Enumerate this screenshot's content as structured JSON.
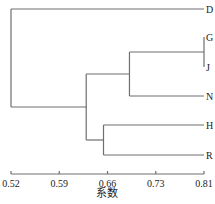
{
  "chart_data": {
    "type": "dendrogram",
    "title": "",
    "xlabel": "系数",
    "ylabel": "",
    "xlim": [
      0.52,
      0.81
    ],
    "ticks": [
      0.52,
      0.5925,
      0.665,
      0.7375,
      0.81
    ],
    "tick_labels": [
      "0.52",
      "0.59",
      "0.66",
      "0.73",
      "0.81"
    ],
    "leaves": [
      "D",
      "G",
      "J",
      "N",
      "H",
      "R"
    ],
    "merges": [
      {
        "id": "GJ",
        "children": [
          "G",
          "J"
        ],
        "height": 0.81
      },
      {
        "id": "HR",
        "children": [
          "H",
          "R"
        ],
        "height": 0.659
      },
      {
        "id": "GJN",
        "children": [
          "GJ",
          "N"
        ],
        "height": 0.698
      },
      {
        "id": "GJNHR",
        "children": [
          "GJN",
          "HR"
        ],
        "height": 0.633
      },
      {
        "id": "root",
        "children": [
          "D",
          "GJNHR"
        ],
        "height": 0.52
      }
    ],
    "line_color": "#6e6e6e"
  }
}
